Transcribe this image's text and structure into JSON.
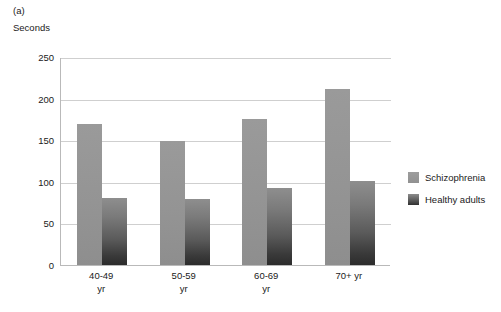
{
  "figure": {
    "panel_label": "(a)",
    "axis_unit_label": "Seconds"
  },
  "chart_data": {
    "type": "bar",
    "title": "",
    "subtitle": "",
    "xlabel": "",
    "ylabel": "Seconds",
    "ylim": [
      0,
      250
    ],
    "ytick_values": [
      0,
      50,
      100,
      150,
      200,
      250
    ],
    "ytick_labels": [
      "0",
      "50",
      "100",
      "150",
      "200",
      "250"
    ],
    "grid": true,
    "legend_position": "right",
    "categories": [
      "40-49 yr",
      "50-59 yr",
      "60-69 yr",
      "70+ yr"
    ],
    "category_lines": [
      [
        "40-49",
        "yr"
      ],
      [
        "50-59",
        "yr"
      ],
      [
        "60-69",
        "yr"
      ],
      [
        "70+ yr",
        ""
      ]
    ],
    "series": [
      {
        "name": "Schizophrenia",
        "color": "#949494",
        "values": [
          170,
          149,
          175,
          212
        ]
      },
      {
        "name": "Healthy adults",
        "color": "#3a3a3a",
        "values": [
          80,
          79,
          93,
          101
        ]
      }
    ]
  },
  "legend": {
    "entries": [
      {
        "label": "Schizophrenia"
      },
      {
        "label": "Healthy adults"
      }
    ]
  }
}
